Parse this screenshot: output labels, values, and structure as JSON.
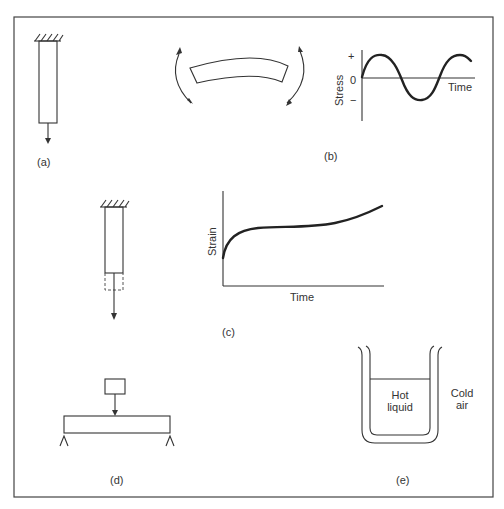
{
  "figure": {
    "panels": {
      "a": {
        "label": "(a)"
      },
      "b": {
        "label": "(b)",
        "chart": {
          "ylabel": "Stress",
          "xlabel": "Time",
          "ticks": {
            "plus": "+",
            "zero": "0",
            "minus": "−"
          }
        }
      },
      "c": {
        "label": "(c)",
        "chart": {
          "ylabel": "Strain",
          "xlabel": "Time"
        }
      },
      "d": {
        "label": "(d)"
      },
      "e": {
        "label": "(e)",
        "inner_text_1": "Hot",
        "inner_text_2": "liquid",
        "outer_text_1": "Cold",
        "outer_text_2": "air"
      }
    }
  },
  "colors": {
    "line": "#333333",
    "background": "#ffffff"
  }
}
